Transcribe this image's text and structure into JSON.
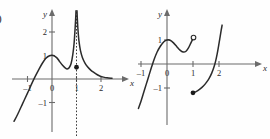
{
  "figure": {
    "label": ")",
    "background": "#fefefe",
    "curve_color": "#2b2b2b",
    "axis_color": "#6b6b6b"
  },
  "chart_data": [
    {
      "type": "line",
      "title": "",
      "panel": "left",
      "xlabel": "x",
      "ylabel": "y",
      "xlim": [
        -1.75,
        2.65
      ],
      "ylim": [
        -1.85,
        2.9
      ],
      "xticks": [
        -1,
        0,
        1,
        2
      ],
      "xticklabels": [
        "-1",
        "0",
        "1",
        "2"
      ],
      "yticks": [
        -1,
        1,
        2
      ],
      "yticklabels": [
        "-1",
        "1",
        "2"
      ],
      "grid": false,
      "legend": "none",
      "annotations": [
        {
          "kind": "vertical-asymptote",
          "x": 1,
          "style": "dotted"
        },
        {
          "kind": "filled-point",
          "x": 1,
          "y": 0.5
        }
      ],
      "series": [
        {
          "name": "branch-left",
          "x": [
            -1.55,
            -1.4,
            -1.2,
            -1.0,
            -0.85,
            -0.7,
            -0.55,
            -0.4,
            -0.25,
            -0.1,
            0.05,
            0.2,
            0.32,
            0.45,
            0.55,
            0.62,
            0.7,
            0.78,
            0.85,
            0.9,
            0.94,
            0.965,
            0.98
          ],
          "y": [
            -1.8,
            -1.5,
            -1.05,
            -0.6,
            -0.25,
            0.08,
            0.38,
            0.66,
            0.88,
            0.99,
            1.0,
            0.9,
            0.73,
            0.56,
            0.46,
            0.43,
            0.48,
            0.66,
            1.05,
            1.5,
            2.1,
            2.55,
            2.9
          ]
        },
        {
          "name": "branch-right",
          "x": [
            1.02,
            1.035,
            1.06,
            1.1,
            1.16,
            1.24,
            1.34,
            1.45,
            1.58,
            1.72,
            1.85,
            1.97,
            2.1,
            2.25,
            2.45
          ],
          "y": [
            2.9,
            2.55,
            2.1,
            1.62,
            1.22,
            0.92,
            0.69,
            0.52,
            0.38,
            0.27,
            0.18,
            0.12,
            0.08,
            0.05,
            0.03
          ]
        }
      ]
    },
    {
      "type": "line",
      "title": "",
      "panel": "right",
      "xlabel": "x",
      "ylabel": "y",
      "xlim": [
        -1.8,
        2.75
      ],
      "ylim": [
        -1.9,
        2.0
      ],
      "xticks": [
        -1,
        0,
        1,
        2
      ],
      "xticklabels": [
        "-1",
        "0",
        "1",
        "2"
      ],
      "yticks": [
        -1,
        1
      ],
      "yticklabels": [
        "-1",
        "1"
      ],
      "grid": false,
      "legend": "none",
      "annotations": [
        {
          "kind": "open-point",
          "x": 1.02,
          "y": 1.1
        },
        {
          "kind": "filled-point",
          "x": 1.0,
          "y": -1.2
        }
      ],
      "series": [
        {
          "name": "branch-left",
          "x": [
            -1.1,
            -1.0,
            -0.9,
            -0.8,
            -0.7,
            -0.6,
            -0.5,
            -0.38,
            -0.25,
            -0.12,
            0.0,
            0.12,
            0.25,
            0.38,
            0.5,
            0.62,
            0.72,
            0.82,
            0.92,
            1.02
          ],
          "y": [
            -1.85,
            -1.55,
            -1.2,
            -0.85,
            -0.5,
            -0.15,
            0.18,
            0.5,
            0.75,
            0.93,
            1.0,
            0.99,
            0.88,
            0.72,
            0.58,
            0.5,
            0.52,
            0.66,
            0.88,
            1.1
          ]
        },
        {
          "name": "branch-right",
          "x": [
            1.0,
            1.12,
            1.25,
            1.4,
            1.52,
            1.62,
            1.72,
            1.8,
            1.87,
            1.93,
            1.98,
            2.03,
            2.08,
            2.12
          ],
          "y": [
            -1.2,
            -1.15,
            -1.06,
            -0.92,
            -0.76,
            -0.6,
            -0.38,
            -0.15,
            0.12,
            0.42,
            0.72,
            1.05,
            1.38,
            1.62
          ]
        }
      ]
    }
  ]
}
